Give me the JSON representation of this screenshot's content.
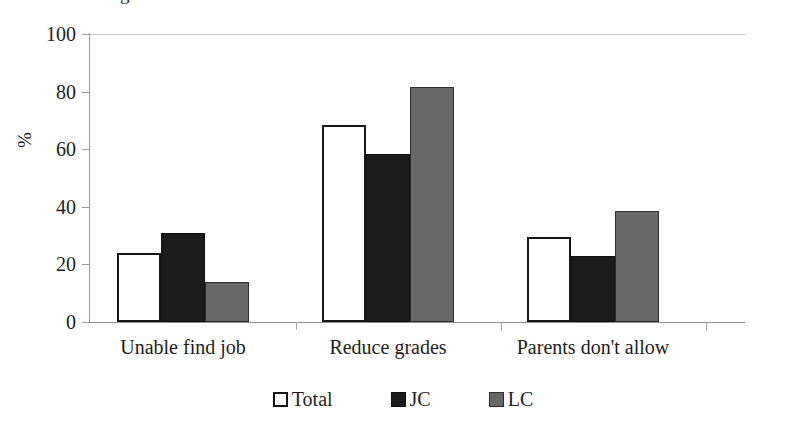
{
  "figure": {
    "clipped_top_text": "g",
    "y_axis_title": "%",
    "background_color": "#ffffff"
  },
  "legend": {
    "position": "bottom-center",
    "items": [
      {
        "label": "Total",
        "swatch": "white-outlined-square-icon",
        "color": "#ffffff"
      },
      {
        "label": "JC",
        "swatch": "black-filled-square-icon",
        "color": "#1b1b1b"
      },
      {
        "label": "LC",
        "swatch": "gray-filled-square-icon",
        "color": "#686868"
      }
    ]
  },
  "chart_data": {
    "type": "bar",
    "title": "",
    "subtitle": "",
    "xlabel": "",
    "ylabel": "%",
    "ylim": [
      0,
      100
    ],
    "yticks": [
      0,
      20,
      40,
      60,
      80,
      100
    ],
    "ytick_labels": [
      "0",
      "20",
      "40",
      "60",
      "80",
      "100"
    ],
    "grid": false,
    "legend_position": "bottom-center",
    "categories": [
      "Unable find job",
      "Reduce grades",
      "Parents don't allow"
    ],
    "series": [
      {
        "name": "Total",
        "color": "#ffffff",
        "values": [
          24,
          68.5,
          29.5
        ]
      },
      {
        "name": "JC",
        "color": "#1b1b1b",
        "values": [
          31,
          58.5,
          23
        ]
      },
      {
        "name": "LC",
        "color": "#686868",
        "values": [
          14,
          81.5,
          38.5
        ]
      }
    ]
  }
}
